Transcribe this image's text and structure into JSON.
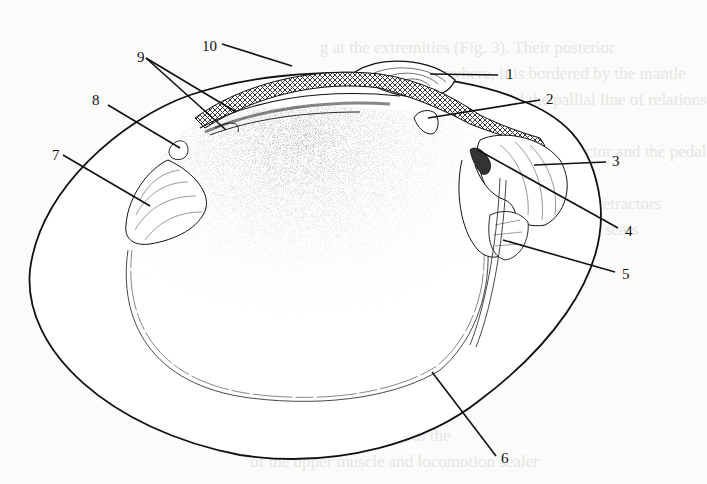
{
  "figure": {
    "background_text_lines": [
      {
        "text": "g at the extremities (Fig. 3). Their posterior",
        "x": 320,
        "y": 52
      },
      {
        "text": "Elsewhere, it is bordered by the mantle",
        "x": 420,
        "y": 78
      },
      {
        "text": "in trains and the pallial line of relations",
        "x": 440,
        "y": 104
      },
      {
        "text": "the anterior adductor and the pedal",
        "x": 470,
        "y": 156
      },
      {
        "text": "the shell and the siphonal retractors",
        "x": 420,
        "y": 208
      },
      {
        "text": "as the muscle attachment scars",
        "x": 430,
        "y": 234
      },
      {
        "text": "and growth stages are visible",
        "x": 300,
        "y": 286
      },
      {
        "text": "ructure and Locomotive Tests",
        "x": 250,
        "y": 375
      },
      {
        "text": "cale of the shell is used to the",
        "x": 250,
        "y": 440
      },
      {
        "text": "of the upper muscle and locomotion sealer",
        "x": 250,
        "y": 466
      }
    ],
    "labels": [
      {
        "id": "1",
        "text": "1",
        "x": 506,
        "y": 79,
        "line": [
          498,
          75,
          430,
          74
        ]
      },
      {
        "id": "2",
        "text": "2",
        "x": 546,
        "y": 104,
        "line": [
          540,
          100,
          428,
          118
        ]
      },
      {
        "id": "3",
        "text": "3",
        "x": 612,
        "y": 166,
        "line": [
          606,
          162,
          534,
          165
        ]
      },
      {
        "id": "4",
        "text": "4",
        "x": 625,
        "y": 236,
        "line": [
          618,
          228,
          478,
          150
        ]
      },
      {
        "id": "5",
        "text": "5",
        "x": 622,
        "y": 279,
        "line": [
          615,
          272,
          503,
          240
        ]
      },
      {
        "id": "6",
        "text": "6",
        "x": 501,
        "y": 463,
        "line": [
          496,
          456,
          432,
          372
        ]
      },
      {
        "id": "7",
        "text": "7",
        "x": 52,
        "y": 160,
        "line": [
          63,
          155,
          150,
          206
        ]
      },
      {
        "id": "8",
        "text": "8",
        "x": 92,
        "y": 105,
        "line": [
          108,
          105,
          180,
          148
        ]
      },
      {
        "id": "9",
        "text": "9",
        "x": 137,
        "y": 62,
        "lines": [
          [
            146,
            58,
            236,
            112
          ],
          [
            146,
            58,
            226,
            130
          ]
        ]
      },
      {
        "id": "10",
        "text": "10",
        "x": 202,
        "y": 51,
        "line": [
          222,
          44,
          292,
          66
        ]
      }
    ],
    "colors": {
      "ink": "#111111",
      "paper": "#fbfbfa",
      "stipple": "#555555",
      "bleed_text": "#e6e6e3"
    }
  }
}
